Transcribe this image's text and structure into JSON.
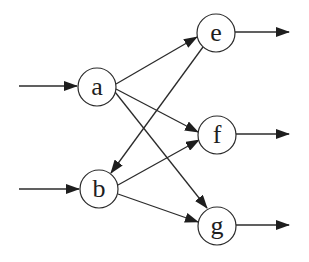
{
  "diagram": {
    "type": "directed-graph",
    "colors": {
      "stroke": "#2b2b2b",
      "node_fill": "#ffffff",
      "label": "#1e1e1e",
      "background": "#ffffff"
    },
    "nodes": [
      {
        "id": "a",
        "label": "a",
        "cx": 97,
        "cy": 87,
        "r": 19
      },
      {
        "id": "b",
        "label": "b",
        "cx": 99,
        "cy": 189,
        "r": 19
      },
      {
        "id": "e",
        "label": "e",
        "cx": 216,
        "cy": 33,
        "r": 19
      },
      {
        "id": "f",
        "label": "f",
        "cx": 217,
        "cy": 135,
        "r": 19
      },
      {
        "id": "g",
        "label": "g",
        "cx": 217,
        "cy": 226,
        "r": 19
      }
    ],
    "edges": [
      {
        "from": "input",
        "to": "a",
        "x1": 19,
        "y1": 86,
        "x2": 77,
        "y2": 86
      },
      {
        "from": "input",
        "to": "b",
        "x1": 19,
        "y1": 189,
        "x2": 79,
        "y2": 189
      },
      {
        "from": "a",
        "to": "e",
        "x1": 116,
        "y1": 84,
        "x2": 197,
        "y2": 37
      },
      {
        "from": "a",
        "to": "f",
        "x1": 116,
        "y1": 89,
        "x2": 198,
        "y2": 132
      },
      {
        "from": "a",
        "to": "g",
        "x1": 115,
        "y1": 92,
        "x2": 207,
        "y2": 208
      },
      {
        "from": "e",
        "to": "b",
        "x1": 203,
        "y1": 47,
        "x2": 111,
        "y2": 173
      },
      {
        "from": "b",
        "to": "f",
        "x1": 118,
        "y1": 185,
        "x2": 199,
        "y2": 140
      },
      {
        "from": "b",
        "to": "g",
        "x1": 118,
        "y1": 194,
        "x2": 198,
        "y2": 222
      },
      {
        "from": "e",
        "to": "output",
        "x1": 235,
        "y1": 32,
        "x2": 289,
        "y2": 32
      },
      {
        "from": "f",
        "to": "output",
        "x1": 236,
        "y1": 134,
        "x2": 289,
        "y2": 134
      },
      {
        "from": "g",
        "to": "output",
        "x1": 236,
        "y1": 225,
        "x2": 289,
        "y2": 225
      }
    ]
  }
}
